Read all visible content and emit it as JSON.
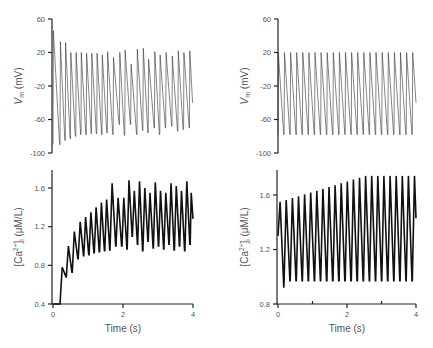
{
  "chart_data": [
    {
      "id": "top-left",
      "type": "line",
      "title": "",
      "xlabel": "",
      "ylabel": "V_m (mV)",
      "ylabel_main": "V",
      "ylabel_sub": "m",
      "ylabel_rest": " (mV)",
      "xlim": [
        0,
        4
      ],
      "ylim": [
        -100,
        60
      ],
      "yticks": [
        60,
        20,
        -20,
        -60,
        -100
      ],
      "xticks": [],
      "grid": false,
      "series": [
        {
          "name": "Membrane potential",
          "spike_times": [
            0.0,
            0.2,
            0.35,
            0.5,
            0.65,
            0.8,
            0.95,
            1.1,
            1.25,
            1.4,
            1.55,
            1.72,
            1.9,
            2.05,
            2.22,
            2.4,
            2.57,
            2.72,
            2.9,
            3.05,
            3.22,
            3.4,
            3.57,
            3.73,
            3.9
          ],
          "peaks": [
            46,
            33,
            32,
            20,
            20,
            20,
            19,
            19,
            19,
            17,
            21,
            14,
            20,
            23,
            6,
            24,
            25,
            12,
            21,
            17,
            20,
            16,
            22,
            20,
            22
          ],
          "troughs": [
            -90,
            -85,
            -83,
            -80,
            -78,
            -78,
            -77,
            -77,
            -78,
            -76,
            -78,
            -66,
            -79,
            -66,
            -78,
            -73,
            -76,
            -70,
            -78,
            -70,
            -68,
            -74,
            -72,
            -70,
            -40
          ]
        }
      ]
    },
    {
      "id": "bottom-left",
      "type": "line",
      "title": "",
      "xlabel": "Time (s)",
      "ylabel": "[Ca2+]i (μM/L)",
      "xlim": [
        0,
        4
      ],
      "ylim": [
        0.4,
        1.8
      ],
      "yticks": [
        1.6,
        1.2,
        0.8,
        0.4
      ],
      "xticks": [
        0,
        2,
        4
      ],
      "grid": false,
      "series": [
        {
          "name": "Intracellular calcium",
          "spike_times": [
            0.0,
            0.2,
            0.38,
            0.55,
            0.72,
            0.88,
            1.03,
            1.18,
            1.33,
            1.48,
            1.63,
            1.8,
            1.97,
            2.12,
            2.27,
            2.42,
            2.57,
            2.72,
            2.87,
            3.02,
            3.17,
            3.32,
            3.47,
            3.62,
            3.77,
            3.92
          ],
          "peaks": [
            0.4,
            0.78,
            1.0,
            1.15,
            1.25,
            1.3,
            1.35,
            1.4,
            1.45,
            1.48,
            1.65,
            1.5,
            1.5,
            1.68,
            1.57,
            1.67,
            1.6,
            1.55,
            1.66,
            1.57,
            1.55,
            1.65,
            1.62,
            1.57,
            1.67,
            1.55
          ],
          "troughs": [
            0.4,
            0.68,
            0.73,
            0.87,
            0.9,
            0.91,
            0.93,
            0.94,
            0.95,
            0.96,
            1.0,
            1.0,
            0.97,
            1.1,
            1.02,
            0.95,
            1.05,
            0.98,
            1.0,
            0.97,
            1.02,
            0.96,
            1.0,
            0.95,
            1.02,
            1.28
          ]
        }
      ]
    },
    {
      "id": "top-right",
      "type": "line",
      "title": "",
      "xlabel": "",
      "ylabel": "V_m (mV)",
      "ylabel_main": "V",
      "ylabel_sub": "m",
      "ylabel_rest": " (mV)",
      "xlim": [
        0,
        4
      ],
      "ylim": [
        -100,
        60
      ],
      "yticks": [
        60,
        20,
        -20,
        -60,
        -100
      ],
      "xticks": [],
      "grid": false,
      "series": [
        {
          "name": "Membrane potential",
          "period_s": 0.177,
          "n_spikes": 23,
          "peak": 20,
          "trough": -78,
          "end_value": -40
        }
      ]
    },
    {
      "id": "bottom-right",
      "type": "line",
      "title": "",
      "xlabel": "Time (s)",
      "ylabel": "[Ca2+]i (μM/L)",
      "xlim": [
        0,
        4
      ],
      "ylim": [
        0.8,
        1.8
      ],
      "yticks": [
        1.6,
        1.2,
        0.8
      ],
      "xticks": [
        0,
        2,
        4
      ],
      "minor_xticks": [
        1,
        3
      ],
      "grid": false,
      "series": [
        {
          "name": "Intracellular calcium",
          "period_s": 0.177,
          "n_spikes": 23,
          "peak_start": 1.55,
          "peak_end": 1.74,
          "first_trough": 0.92,
          "trough": 0.97,
          "end_value": 1.43
        }
      ]
    }
  ],
  "labels": {
    "time_label": "Time (s)",
    "vm_label": "V",
    "vm_sub": "m",
    "vm_unit": " (mV)",
    "ca_label_pre": "[Ca",
    "ca_sup": "2+",
    "ca_label_mid": "]",
    "ca_sub": "i",
    "ca_unit": " (μM/L)"
  }
}
